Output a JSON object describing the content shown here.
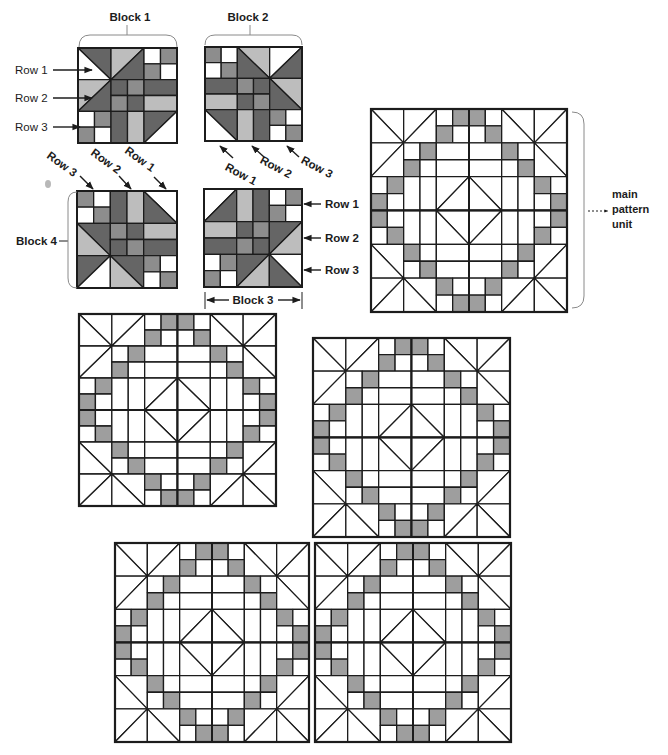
{
  "labels": {
    "block1": "Block 1",
    "block2": "Block 2",
    "block3": "Block 3",
    "block4": "Block 4",
    "main_pattern_unit": [
      "main",
      "pattern",
      "unit"
    ]
  },
  "rows": {
    "block1": [
      "Row 1",
      "Row 2",
      "Row 3"
    ],
    "block2": [
      "Row 1",
      "Row 2",
      "Row 3"
    ],
    "block3": [
      "Row 1",
      "Row 2",
      "Row 3"
    ],
    "block4": [
      "Row 1",
      "Row 2",
      "Row 3"
    ]
  },
  "palette": {
    "w": "#ffffff",
    "l": "#bdbdbd",
    "m": "#8d8d8d",
    "d": "#656565",
    "outline_fill": "#9e9e9e",
    "ink": "#1c1c1c"
  },
  "blocks": {
    "block1": [
      [
        {
          "t": "hst",
          "d": "tlbr",
          "c": [
            "d",
            "w"
          ]
        },
        {
          "t": "hst",
          "d": "trbl",
          "c": [
            "l",
            "d"
          ]
        },
        {
          "t": "four",
          "c": [
            "w",
            "m",
            "m",
            "w"
          ]
        }
      ],
      [
        {
          "t": "hst",
          "d": "trbl",
          "c": [
            "l",
            "d"
          ]
        },
        {
          "t": "four",
          "c": [
            "d",
            "m",
            "m",
            "d"
          ]
        },
        {
          "t": "railh",
          "c": [
            "d",
            "l"
          ]
        }
      ],
      [
        {
          "t": "four",
          "c": [
            "w",
            "m",
            "m",
            "w"
          ]
        },
        {
          "t": "railv",
          "c": [
            "d",
            "l"
          ]
        },
        {
          "t": "hst",
          "d": "trbl",
          "c": [
            "d",
            "w"
          ]
        }
      ]
    ],
    "block2": [
      [
        {
          "t": "four",
          "c": [
            "m",
            "w",
            "w",
            "m"
          ]
        },
        {
          "t": "hst",
          "d": "tlbr",
          "c": [
            "l",
            "d"
          ]
        },
        {
          "t": "hst",
          "d": "trbl",
          "c": [
            "w",
            "d"
          ]
        }
      ],
      [
        {
          "t": "railh",
          "c": [
            "d",
            "l"
          ]
        },
        {
          "t": "four",
          "c": [
            "m",
            "d",
            "d",
            "m"
          ]
        },
        {
          "t": "hst",
          "d": "tlbr",
          "c": [
            "l",
            "d"
          ]
        }
      ],
      [
        {
          "t": "hst",
          "d": "tlbr",
          "c": [
            "d",
            "w"
          ]
        },
        {
          "t": "railv",
          "c": [
            "l",
            "d"
          ]
        },
        {
          "t": "four",
          "c": [
            "m",
            "w",
            "w",
            "m"
          ]
        }
      ]
    ],
    "block3": [
      [
        {
          "t": "hst",
          "d": "trbl",
          "c": [
            "w",
            "d"
          ]
        },
        {
          "t": "railv",
          "c": [
            "l",
            "d"
          ]
        },
        {
          "t": "four",
          "c": [
            "w",
            "m",
            "m",
            "w"
          ]
        }
      ],
      [
        {
          "t": "railh",
          "c": [
            "l",
            "d"
          ]
        },
        {
          "t": "four",
          "c": [
            "d",
            "m",
            "m",
            "d"
          ]
        },
        {
          "t": "hst",
          "d": "trbl",
          "c": [
            "d",
            "l"
          ]
        }
      ],
      [
        {
          "t": "four",
          "c": [
            "w",
            "m",
            "m",
            "w"
          ]
        },
        {
          "t": "hst",
          "d": "trbl",
          "c": [
            "d",
            "l"
          ]
        },
        {
          "t": "hst",
          "d": "tlbr",
          "c": [
            "w",
            "d"
          ]
        }
      ]
    ],
    "block4": [
      [
        {
          "t": "four",
          "c": [
            "m",
            "w",
            "w",
            "m"
          ]
        },
        {
          "t": "railv",
          "c": [
            "d",
            "l"
          ]
        },
        {
          "t": "hst",
          "d": "tlbr",
          "c": [
            "w",
            "d"
          ]
        }
      ],
      [
        {
          "t": "hst",
          "d": "tlbr",
          "c": [
            "d",
            "l"
          ]
        },
        {
          "t": "four",
          "c": [
            "m",
            "d",
            "d",
            "m"
          ]
        },
        {
          "t": "railh",
          "c": [
            "l",
            "d"
          ]
        }
      ],
      [
        {
          "t": "hst",
          "d": "trbl",
          "c": [
            "d",
            "w"
          ]
        },
        {
          "t": "hst",
          "d": "tlbr",
          "c": [
            "d",
            "l"
          ]
        },
        {
          "t": "four",
          "c": [
            "m",
            "w",
            "w",
            "m"
          ]
        }
      ]
    ]
  },
  "pattern_unit": {
    "quadrants": [
      [
        "block1",
        "block2"
      ],
      [
        "block4",
        "block3"
      ]
    ],
    "shaded_cell_type": "four",
    "shaded_tone": "m"
  },
  "quilt_repeats": 4
}
